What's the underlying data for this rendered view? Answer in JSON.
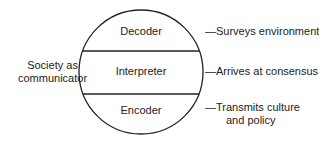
{
  "diagram": {
    "left_label": [
      "Society as",
      "communicator"
    ],
    "sections": [
      {
        "label": "Decoder",
        "description": [
          "—Surveys environment"
        ]
      },
      {
        "label": "Interpreter",
        "description": [
          "—Arrives at consensus"
        ]
      },
      {
        "label": "Encoder",
        "description": [
          "—Transmits culture",
          "and policy"
        ]
      }
    ],
    "colors": {
      "stroke": "#222222",
      "background": "#ffffff"
    }
  }
}
